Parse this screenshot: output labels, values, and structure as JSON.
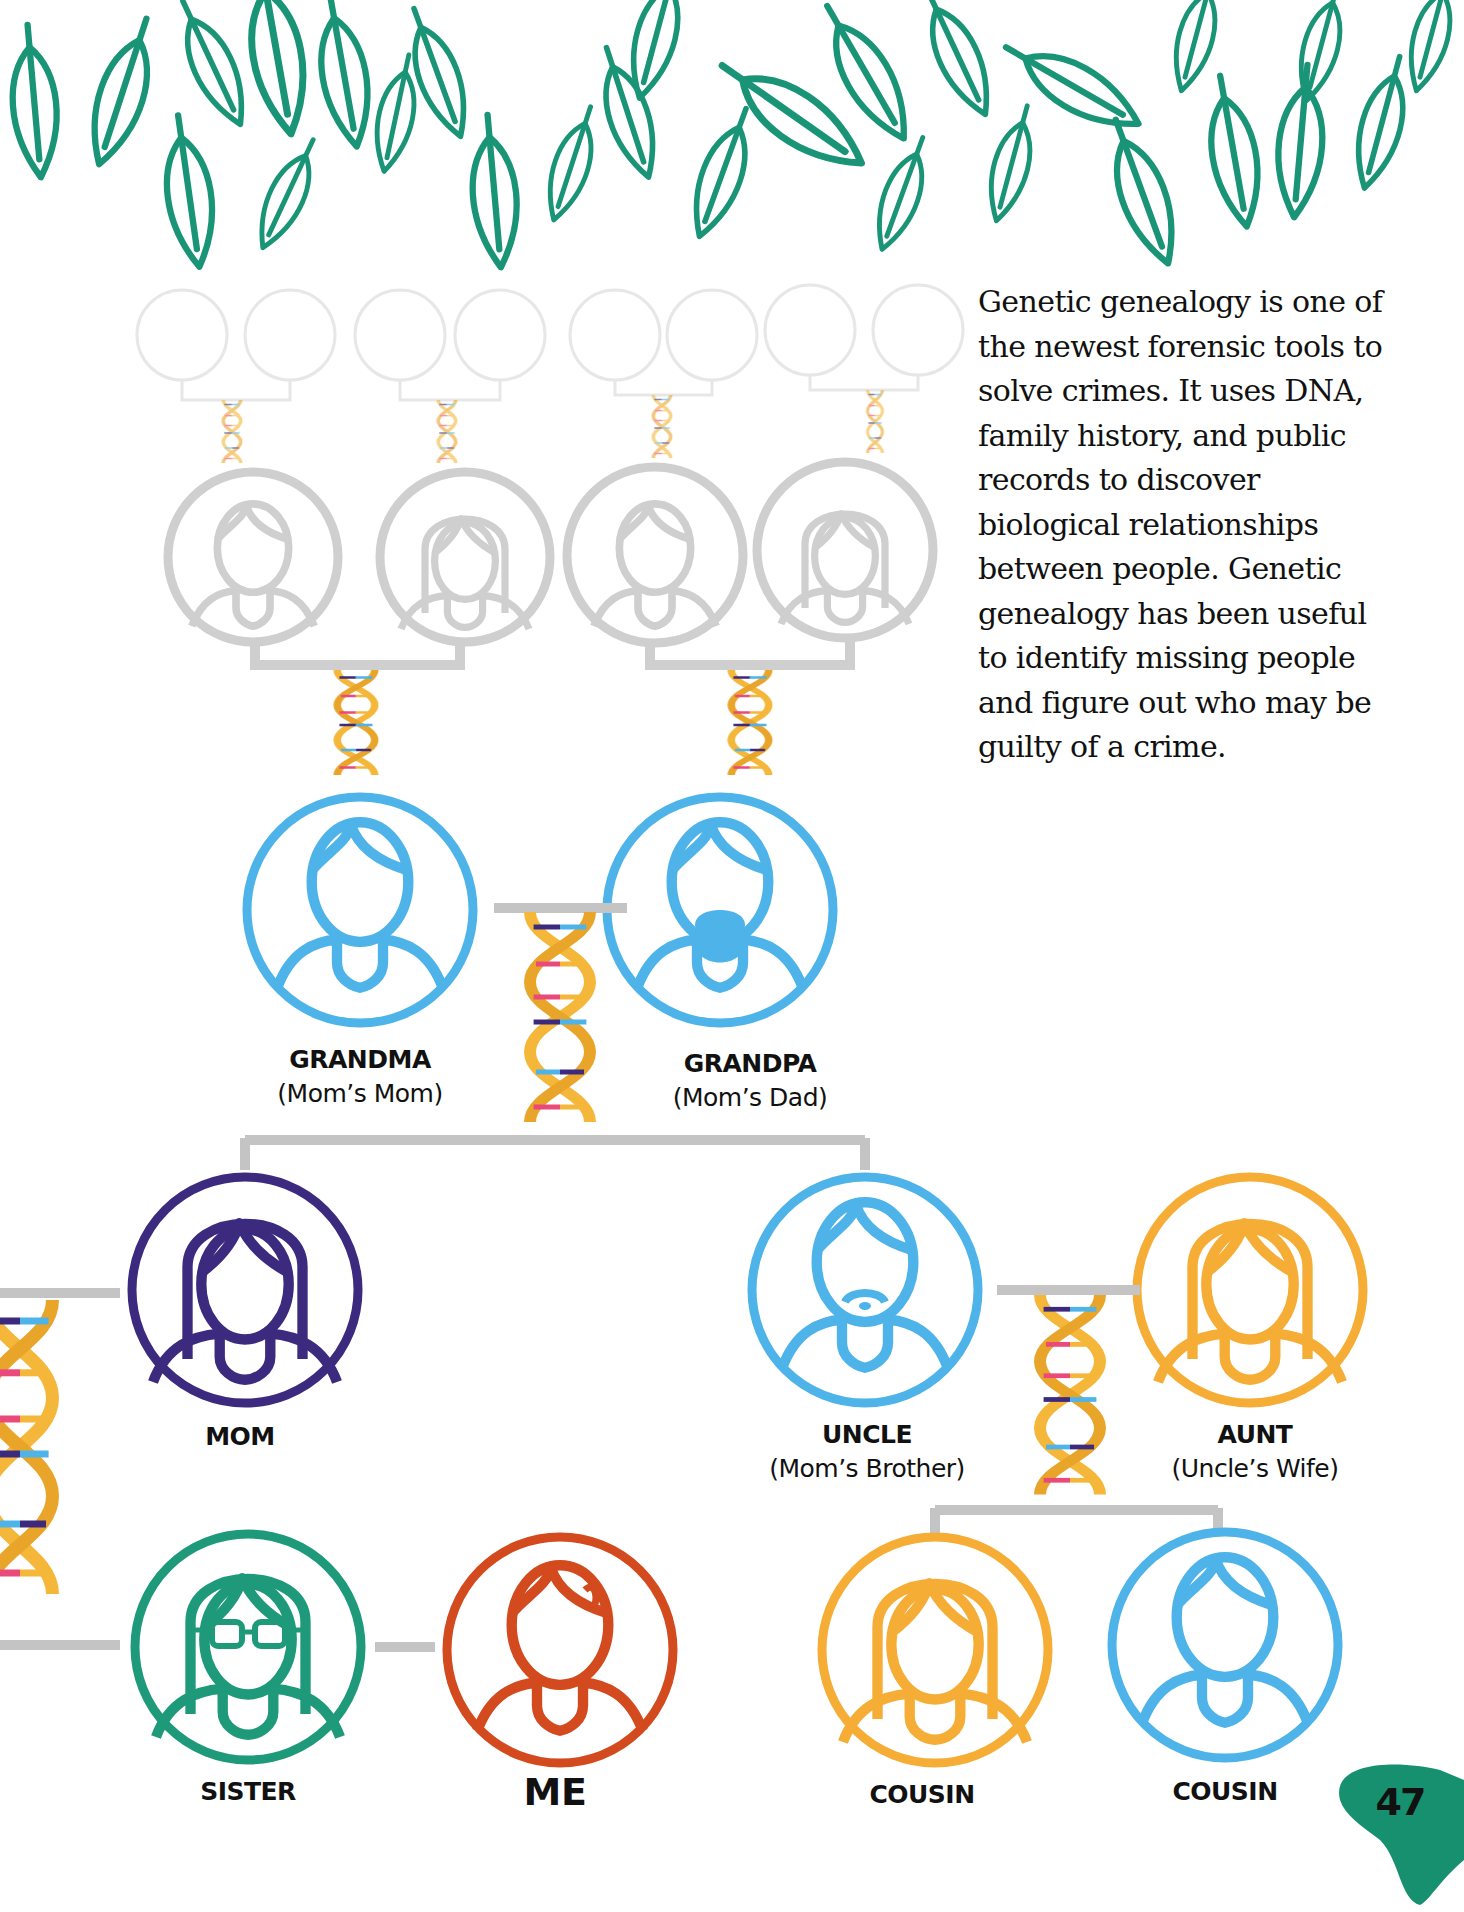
{
  "page": {
    "intro_text": "Genetic genealogy is one of the newest forensic tools to solve crimes. It uses DNA, family history, and public records to discover biological relationships between people. Genetic genealogy has been useful to identify missing people and figure out who may be guilty of a crime.",
    "page_number": "47"
  },
  "colors": {
    "leaf_green": "#1a9477",
    "faded_gray": "#c8c8c8",
    "connector_gray": "#c4c4c4",
    "grandparents_blue": "#4db3e8",
    "mom_purple": "#3b2a7e",
    "uncle_blue": "#4db3e8",
    "aunt_orange": "#f5ad35",
    "sister_green": "#1e9a7a",
    "me_red": "#d24a1e",
    "cousin_orange": "#f5ad35",
    "cousin_blue": "#4db3e8",
    "dna_gold": "#f4b73a",
    "page_badge": "#16906f"
  },
  "family": {
    "grandma": {
      "title": "GRANDMA",
      "subtitle": "(Mom’s Mom)"
    },
    "grandpa": {
      "title": "GRANDPA",
      "subtitle": "(Mom’s Dad)"
    },
    "mom": {
      "title": "MOM"
    },
    "uncle": {
      "title": "UNCLE",
      "subtitle": "(Mom’s Brother)"
    },
    "aunt": {
      "title": "AUNT",
      "subtitle": "(Uncle’s Wife)"
    },
    "sister": {
      "title": "SISTER"
    },
    "me": {
      "title": "ME"
    },
    "cousin1": {
      "title": "COUSIN"
    },
    "cousin2": {
      "title": "COUSIN"
    }
  }
}
